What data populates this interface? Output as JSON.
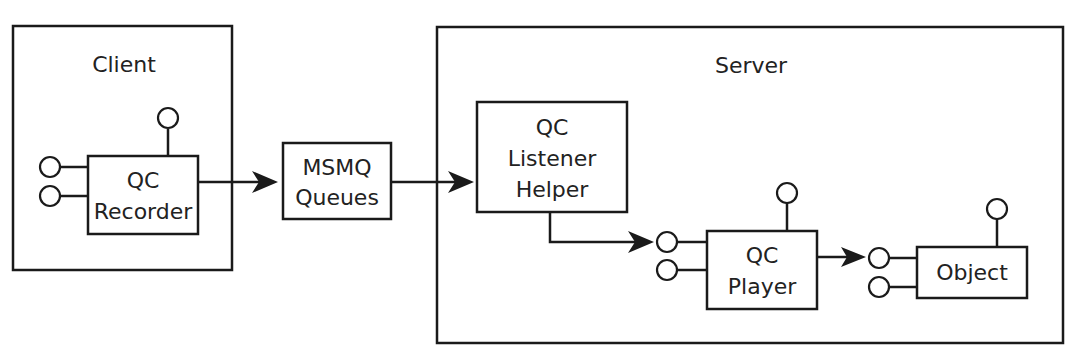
{
  "diagram": {
    "containers": [
      {
        "id": "client",
        "label": "Client"
      },
      {
        "id": "server",
        "label": "Server"
      }
    ],
    "components": [
      {
        "id": "qc-recorder",
        "lines": [
          "QC",
          "Recorder"
        ],
        "container": "client"
      },
      {
        "id": "msmq-queues",
        "lines": [
          "MSMQ",
          "Queues"
        ],
        "container": null
      },
      {
        "id": "qc-listener-helper",
        "lines": [
          "QC",
          "Listener",
          "Helper"
        ],
        "container": "server"
      },
      {
        "id": "qc-player",
        "lines": [
          "QC",
          "Player"
        ],
        "container": "server"
      },
      {
        "id": "object",
        "lines": [
          "Object"
        ],
        "container": "server"
      }
    ],
    "connections": [
      {
        "from": "qc-recorder",
        "to": "msmq-queues"
      },
      {
        "from": "msmq-queues",
        "to": "qc-listener-helper"
      },
      {
        "from": "qc-listener-helper",
        "to": "qc-player"
      },
      {
        "from": "qc-player",
        "to": "object"
      }
    ],
    "colors": {
      "stroke": "#1a1a1a",
      "text": "#222222",
      "background": "#ffffff"
    }
  }
}
